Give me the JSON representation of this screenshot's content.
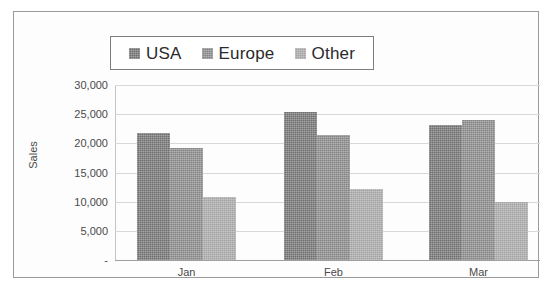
{
  "chart_data": {
    "type": "bar",
    "title": "",
    "subtitle": "",
    "xlabel": "",
    "ylabel": "Sales",
    "categories": [
      "Jan",
      "Feb",
      "Mar"
    ],
    "series": [
      {
        "name": "USA",
        "values": [
          21700,
          25400,
          23100
        ],
        "color": "#6e6e6e"
      },
      {
        "name": "Europe",
        "values": [
          19200,
          21500,
          24000
        ],
        "color": "#848484"
      },
      {
        "name": "Other",
        "values": [
          10800,
          12100,
          9900
        ],
        "color": "#a3a3a3"
      }
    ],
    "ylim": [
      0,
      30000
    ],
    "ytick_labels": [
      "30,000",
      "25,000",
      "20,000",
      "15,000",
      "10,000",
      "5,000",
      "-"
    ],
    "ytick_values": [
      30000,
      25000,
      20000,
      15000,
      10000,
      5000,
      0
    ],
    "grid": true,
    "legend_position": "top-center",
    "legend_entries": [
      "USA",
      "Europe",
      "Other"
    ],
    "annotations": []
  },
  "legend": {
    "items": [
      {
        "label": "USA"
      },
      {
        "label": "Europe"
      },
      {
        "label": "Other"
      }
    ]
  },
  "axes": {
    "y_title": "Sales"
  }
}
